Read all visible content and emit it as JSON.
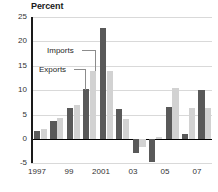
{
  "chart_data": {
    "type": "bar",
    "title": "Percent",
    "xlabel": "",
    "ylabel": "Percent",
    "ylim": [
      -5,
      25
    ],
    "yticks": [
      25,
      20,
      15,
      10,
      5,
      0,
      -5
    ],
    "grid": true,
    "legend_position": "inline-callout",
    "categories": [
      "1997",
      "1998",
      "1999",
      "2000",
      "2001",
      "2002",
      "2003",
      "2004",
      "2005",
      "2006",
      "2007"
    ],
    "tick_labels": [
      "1997",
      "",
      "99",
      "",
      "2001",
      "",
      "03",
      "",
      "05",
      "",
      "07"
    ],
    "series": [
      {
        "name": "Exports",
        "color": "#595959",
        "values": [
          1.5,
          3.6,
          6.4,
          10.3,
          22.7,
          6.1,
          -2.9,
          -4.8,
          6.6,
          0.9,
          10.1
        ]
      },
      {
        "name": "Imports",
        "color": "#d2d2d2",
        "values": [
          2.0,
          4.2,
          6.9,
          14.0,
          14.0,
          4.0,
          -1.7,
          0.3,
          10.5,
          6.4,
          6.4
        ]
      }
    ],
    "annotations": [
      {
        "text": "Imports",
        "points_to": "2000-imports-bar"
      },
      {
        "text": "Exports",
        "points_to": "2000-exports-bar"
      }
    ]
  },
  "axis": {
    "y_labels": [
      "25",
      "20",
      "15",
      "10",
      "5",
      "0",
      "-5"
    ],
    "x_labels": [
      "1997",
      "99",
      "2001",
      "03",
      "05",
      "07"
    ]
  },
  "callouts": {
    "imports": "Imports",
    "exports": "Exports"
  }
}
